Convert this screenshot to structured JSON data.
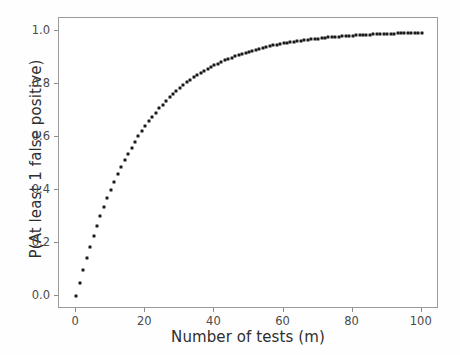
{
  "chart_data": {
    "type": "scatter",
    "title": "",
    "xlabel": "Number of tests (m)",
    "ylabel": "P(At least 1 false positive)",
    "xlim": [
      -5,
      105
    ],
    "ylim": [
      -0.05,
      1.05
    ],
    "xticks": [
      0,
      20,
      40,
      60,
      80,
      100
    ],
    "xtick_labels": [
      "0",
      "20",
      "40",
      "60",
      "80",
      "100"
    ],
    "yticks": [
      0.0,
      0.2,
      0.4,
      0.6,
      0.8,
      1.0
    ],
    "ytick_labels": [
      "0.0",
      "0.2",
      "0.4",
      "0.6",
      "0.8",
      "1.0"
    ],
    "grid": false,
    "legend": null,
    "marker": "square",
    "marker_color": "#1a1a1a",
    "marker_size": 3,
    "formula": "P = 1 - (1 - 0.05)^m",
    "x": [
      0,
      1,
      2,
      3,
      4,
      5,
      6,
      7,
      8,
      9,
      10,
      11,
      12,
      13,
      14,
      15,
      16,
      17,
      18,
      19,
      20,
      21,
      22,
      23,
      24,
      25,
      26,
      27,
      28,
      29,
      30,
      31,
      32,
      33,
      34,
      35,
      36,
      37,
      38,
      39,
      40,
      41,
      42,
      43,
      44,
      45,
      46,
      47,
      48,
      49,
      50,
      51,
      52,
      53,
      54,
      55,
      56,
      57,
      58,
      59,
      60,
      61,
      62,
      63,
      64,
      65,
      66,
      67,
      68,
      69,
      70,
      71,
      72,
      73,
      74,
      75,
      76,
      77,
      78,
      79,
      80,
      81,
      82,
      83,
      84,
      85,
      86,
      87,
      88,
      89,
      90,
      91,
      92,
      93,
      94,
      95,
      96,
      97,
      98,
      99,
      100
    ],
    "y": [
      0.0,
      0.05,
      0.0975,
      0.142625,
      0.185494,
      0.226219,
      0.264908,
      0.301663,
      0.33658,
      0.369751,
      0.401263,
      0.4312,
      0.45964,
      0.486658,
      0.512325,
      0.536709,
      0.559873,
      0.58188,
      0.602786,
      0.622646,
      0.641514,
      0.659438,
      0.676466,
      0.692643,
      0.708011,
      0.72261,
      0.73648,
      0.749656,
      0.762173,
      0.774064,
      0.785361,
      0.796093,
      0.806288,
      0.815974,
      0.825175,
      0.833916,
      0.84222,
      0.850109,
      0.857604,
      0.864724,
      0.871488,
      0.877913,
      0.884018,
      0.889817,
      0.895326,
      0.90056,
      0.905532,
      0.910255,
      0.914742,
      0.919005,
      0.923055,
      0.926902,
      0.930557,
      0.934029,
      0.937328,
      0.940461,
      0.943438,
      0.946266,
      0.948953,
      0.951506,
      0.95393,
      0.956234,
      0.958422,
      0.960501,
      0.962476,
      0.964352,
      0.966134,
      0.967828,
      0.969436,
      0.970964,
      0.972416,
      0.973795,
      0.975106,
      0.97635,
      0.977533,
      0.978656,
      0.979723,
      0.980737,
      0.9817,
      0.982615,
      0.983484,
      0.98431,
      0.985095,
      0.98584,
      0.986548,
      0.987221,
      0.98786,
      0.988467,
      0.989044,
      0.989591,
      0.990112,
      0.990606,
      0.991076,
      0.991522,
      0.991946,
      0.992349,
      0.992731,
      0.993095,
      0.99344,
      0.993768,
      0.99408
    ]
  }
}
